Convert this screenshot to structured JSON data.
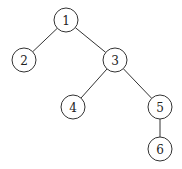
{
  "diagram": {
    "type": "tree",
    "nodes": [
      {
        "id": "1",
        "label": "1",
        "x": 66,
        "y": 20
      },
      {
        "id": "2",
        "label": "2",
        "x": 24,
        "y": 60
      },
      {
        "id": "3",
        "label": "3",
        "x": 115,
        "y": 60
      },
      {
        "id": "4",
        "label": "4",
        "x": 73,
        "y": 107
      },
      {
        "id": "5",
        "label": "5",
        "x": 160,
        "y": 107
      },
      {
        "id": "6",
        "label": "6",
        "x": 160,
        "y": 149
      }
    ],
    "edges": [
      {
        "from": "1",
        "to": "2"
      },
      {
        "from": "1",
        "to": "3"
      },
      {
        "from": "3",
        "to": "4"
      },
      {
        "from": "3",
        "to": "5"
      },
      {
        "from": "5",
        "to": "6"
      }
    ],
    "node_radius": 12
  }
}
